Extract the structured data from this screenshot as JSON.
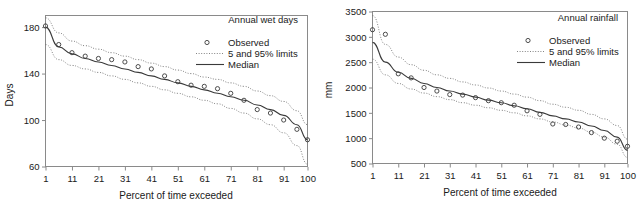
{
  "figure": {
    "panel_count": 2,
    "background_color": "#ffffff",
    "line_color": "#3a3a3a",
    "limit_color": "#6e6e6e",
    "frame_color": "#8a8a8a"
  },
  "chart_data": [
    {
      "type": "line",
      "id": "annual-wet-days",
      "title": "Annual wet days",
      "xlabel": "Percent of time exceeded",
      "ylabel": "Days",
      "xlim": [
        1,
        100
      ],
      "ylim": [
        60,
        190
      ],
      "grid": false,
      "legend_position": "top-right",
      "xticks": [
        1,
        11,
        21,
        31,
        41,
        51,
        61,
        71,
        81,
        91,
        100
      ],
      "xtick_labels": [
        "1",
        "11",
        "21",
        "31",
        "41",
        "51",
        "61",
        "71",
        "81",
        "91",
        "100"
      ],
      "yticks": [
        60,
        100,
        140,
        180
      ],
      "ytick_labels": [
        "60",
        "100",
        "140",
        "180"
      ],
      "legend": [
        {
          "label": "Observed",
          "marker": "open-circle"
        },
        {
          "label": "5 and 95% limits",
          "marker": "dotted-line"
        },
        {
          "label": "Median",
          "marker": "solid-line"
        }
      ],
      "series": [
        {
          "name": "Observed",
          "marker": "open-circle",
          "x": [
            1,
            6,
            11,
            16,
            21,
            26,
            31,
            36,
            41,
            46,
            51,
            56,
            61,
            66,
            71,
            76,
            81,
            86,
            91,
            96,
            100
          ],
          "y": [
            181,
            165,
            158,
            155,
            153,
            152,
            150,
            146,
            144,
            138,
            133,
            130,
            129,
            127,
            123,
            117,
            109,
            106,
            100,
            92,
            83
          ]
        },
        {
          "name": "Median",
          "marker": "solid-line",
          "x": [
            1,
            6,
            11,
            16,
            21,
            26,
            31,
            36,
            41,
            46,
            51,
            56,
            61,
            66,
            71,
            76,
            81,
            86,
            91,
            96,
            100
          ],
          "y": [
            180,
            163,
            157,
            153,
            150,
            147,
            144,
            141,
            138,
            135,
            132,
            129,
            126,
            123,
            120,
            117,
            113,
            109,
            104,
            96,
            83
          ]
        },
        {
          "name": "95% limit",
          "marker": "dotted-line",
          "x": [
            1,
            6,
            11,
            16,
            21,
            26,
            31,
            36,
            41,
            46,
            51,
            56,
            61,
            66,
            71,
            76,
            81,
            86,
            91,
            96,
            100
          ],
          "y": [
            188,
            175,
            168,
            164,
            161,
            158,
            155,
            152,
            149,
            146,
            143,
            140,
            137,
            135,
            132,
            129,
            125,
            121,
            116,
            108,
            96
          ]
        },
        {
          "name": "5% limit",
          "marker": "dotted-line",
          "x": [
            1,
            6,
            11,
            16,
            21,
            26,
            31,
            36,
            41,
            46,
            51,
            56,
            61,
            66,
            71,
            76,
            81,
            86,
            91,
            96,
            100
          ],
          "y": [
            165,
            152,
            147,
            144,
            141,
            138,
            135,
            132,
            129,
            126,
            123,
            120,
            117,
            114,
            110,
            106,
            101,
            96,
            89,
            78,
            62
          ]
        }
      ]
    },
    {
      "type": "line",
      "id": "annual-rainfall",
      "title": "Annual rainfall",
      "xlabel": "Percent of time exceeded",
      "ylabel": "mm",
      "xlim": [
        1,
        100
      ],
      "ylim": [
        500,
        3500
      ],
      "grid": false,
      "legend_position": "top-right",
      "xticks": [
        1,
        11,
        21,
        31,
        41,
        51,
        61,
        71,
        81,
        91,
        100
      ],
      "xtick_labels": [
        "1",
        "11",
        "21",
        "31",
        "41",
        "51",
        "61",
        "71",
        "81",
        "91",
        "100"
      ],
      "yticks": [
        500,
        1000,
        1500,
        2000,
        2500,
        3000,
        3500
      ],
      "ytick_labels": [
        "500",
        "1000",
        "1500",
        "2000",
        "2500",
        "3000",
        "3500"
      ],
      "legend": [
        {
          "label": "Observed",
          "marker": "open-circle"
        },
        {
          "label": "5 and 95% limits",
          "marker": "dotted-line"
        },
        {
          "label": "Median",
          "marker": "solid-line"
        }
      ],
      "series": [
        {
          "name": "Observed",
          "marker": "open-circle",
          "x": [
            1,
            6,
            11,
            16,
            21,
            26,
            31,
            36,
            41,
            46,
            51,
            56,
            61,
            66,
            71,
            76,
            81,
            86,
            91,
            96,
            100
          ],
          "y": [
            3140,
            3050,
            2270,
            2190,
            2000,
            1930,
            1860,
            1850,
            1800,
            1740,
            1700,
            1650,
            1540,
            1470,
            1280,
            1270,
            1220,
            1110,
            1000,
            940,
            840
          ]
        },
        {
          "name": "Median",
          "marker": "solid-line",
          "x": [
            1,
            6,
            11,
            16,
            21,
            26,
            31,
            36,
            41,
            46,
            51,
            56,
            61,
            66,
            71,
            76,
            81,
            86,
            91,
            96,
            100
          ],
          "y": [
            2890,
            2500,
            2300,
            2180,
            2080,
            2000,
            1930,
            1870,
            1810,
            1750,
            1700,
            1640,
            1580,
            1510,
            1440,
            1380,
            1320,
            1240,
            1150,
            1020,
            760
          ]
        },
        {
          "name": "95% limit",
          "marker": "dotted-line",
          "x": [
            1,
            6,
            11,
            16,
            21,
            26,
            31,
            36,
            41,
            46,
            51,
            56,
            61,
            66,
            71,
            76,
            81,
            86,
            91,
            96,
            100
          ],
          "y": [
            3420,
            2850,
            2600,
            2450,
            2340,
            2250,
            2180,
            2110,
            2050,
            1990,
            1930,
            1870,
            1810,
            1740,
            1670,
            1610,
            1550,
            1470,
            1380,
            1250,
            980
          ]
        },
        {
          "name": "5% limit",
          "marker": "dotted-line",
          "x": [
            1,
            6,
            11,
            16,
            21,
            26,
            31,
            36,
            41,
            46,
            51,
            56,
            61,
            66,
            71,
            76,
            81,
            86,
            91,
            96,
            100
          ],
          "y": [
            2560,
            2250,
            2080,
            1970,
            1890,
            1820,
            1760,
            1700,
            1650,
            1600,
            1550,
            1500,
            1440,
            1380,
            1320,
            1260,
            1200,
            1120,
            1020,
            880,
            620
          ]
        }
      ]
    }
  ]
}
